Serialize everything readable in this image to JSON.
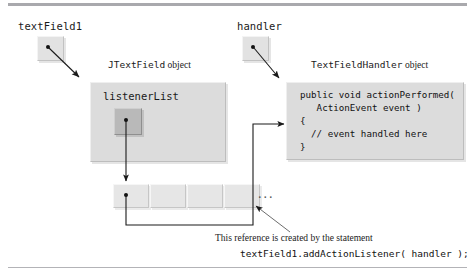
{
  "figure": {
    "background_color": "#ffffff",
    "rule_color": "#a9a9ad"
  },
  "variables": [
    {
      "id": "textfield1",
      "label": "textField1",
      "box_name": "reference-box-textfield1"
    },
    {
      "id": "handler",
      "label": "handler",
      "box_name": "reference-box-handler"
    }
  ],
  "objects": {
    "jtextfield": {
      "class_name": "JTextField",
      "caption_suffix": "object",
      "field_label": "listenerList",
      "slot_name": "listenerlist-slot"
    },
    "handler_object": {
      "class_name": "TextFieldHandler",
      "caption_suffix": "object",
      "code_lines": [
        "public void actionPerformed(",
        "   ActionEvent event )",
        "{",
        "  // event handled here",
        "}"
      ]
    }
  },
  "listener_array": {
    "cells": [
      "",
      "",
      "",
      ""
    ],
    "ellipsis": "...",
    "dot_cell_index": 0
  },
  "annotation": {
    "line1": "This reference is created by the statement",
    "line2": "textField1.addActionListener( handler );"
  },
  "colors": {
    "panel_fill": "#dcdcdc",
    "slot_fill": "#b9b9b9",
    "cell_fill": "#e6e6e6",
    "ref_fill": "#e2e2e2",
    "line": "#1a1a1a"
  }
}
